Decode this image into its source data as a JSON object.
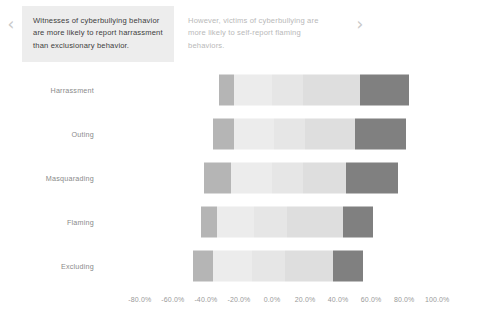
{
  "carousel": {
    "prev_icon": "chevron-left-icon",
    "next_icon": "chevron-right-icon",
    "prev_glyph": "‹",
    "next_glyph": "›",
    "cards": [
      {
        "text": "Witnesses of cyberbullying behavior are more likely to report harrassment than exclusionary behavior.",
        "state": "active"
      },
      {
        "text": "However, victims of cyberbullying are more likely to self-report flaming behaviors.",
        "state": "inactive"
      }
    ]
  },
  "colors": {
    "segment_dark": "#808080",
    "segment_medium": "#b5b5b5",
    "segment_light": "#e6e6e6",
    "segment_lighter": "#ececec",
    "segment_mid_light": "#dedede",
    "card_active_bg": "#ededed",
    "card_active_text": "#3d3d3d",
    "card_inactive_text": "#b9b9b9",
    "axis_text": "#9a9a9a",
    "ylabel_text": "#8a8a8a"
  },
  "chart_data": {
    "type": "bar",
    "subtype": "diverging-stacked-bar",
    "title": "",
    "xlabel": "",
    "ylabel": "",
    "xlim": [
      -80,
      100
    ],
    "grid": false,
    "legend": "none",
    "orientation": "horizontal",
    "categories": [
      "Harrassment",
      "Outing",
      "Masquarading",
      "Flaming",
      "Excluding"
    ],
    "xticks": [
      -80,
      -60,
      -40,
      -20,
      0,
      20,
      40,
      60,
      80,
      100
    ],
    "xticklabels": [
      "-80.0%",
      "-60.0%",
      "-40.0%",
      "-20.0%",
      "0.0%",
      "20.0%",
      "40.0%",
      "60.0%",
      "80.0%",
      "100.0%"
    ],
    "series": [
      {
        "name": "strongly-negative",
        "color": "#b5b5b5",
        "values": [
          9.0,
          13.0,
          16.0,
          10.0,
          12.0
        ]
      },
      {
        "name": "negative",
        "color": "#ececec",
        "values": [
          23.0,
          24.0,
          25.0,
          22.0,
          24.0
        ]
      },
      {
        "name": "neutral",
        "color": "#e6e6e6",
        "values": [
          19.0,
          19.0,
          19.0,
          20.0,
          20.0
        ]
      },
      {
        "name": "positive",
        "color": "#dedede",
        "values": [
          34.0,
          30.0,
          26.0,
          34.0,
          29.0
        ]
      },
      {
        "name": "strongly-positive",
        "color": "#808080",
        "values": [
          30.0,
          31.0,
          31.0,
          18.0,
          18.0
        ]
      }
    ],
    "bar_geometry": [
      {
        "category": "Harrassment",
        "start": -32.0,
        "segments": [
          9.0,
          23.0,
          19.0,
          34.0,
          30.0
        ]
      },
      {
        "category": "Outing",
        "start": -36.0,
        "segments": [
          13.0,
          24.0,
          19.0,
          30.0,
          31.0
        ]
      },
      {
        "category": "Masquarading",
        "start": -41.0,
        "segments": [
          16.0,
          25.0,
          19.0,
          26.0,
          31.0
        ]
      },
      {
        "category": "Flaming",
        "start": -43.0,
        "segments": [
          10.0,
          22.0,
          20.0,
          34.0,
          18.0
        ]
      },
      {
        "category": "Excluding",
        "start": -48.0,
        "segments": [
          12.0,
          24.0,
          20.0,
          29.0,
          18.0
        ]
      }
    ]
  }
}
